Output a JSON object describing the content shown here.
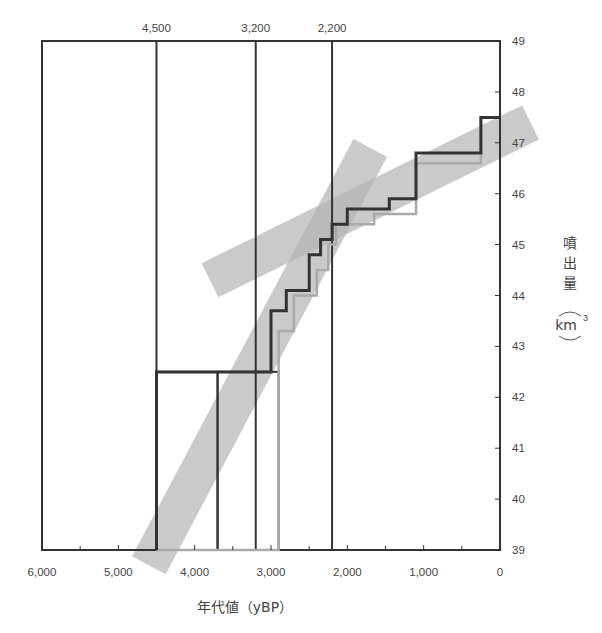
{
  "chart_data": {
    "type": "line",
    "title": "",
    "xlabel": "年代値（yBP）",
    "ylabel": "噴出量（km³）",
    "ylabel_chars": [
      "噴",
      "出",
      "量"
    ],
    "ylabel_unit": "km",
    "ylabel_unit_sup": "3",
    "xlim": [
      6000,
      0
    ],
    "ylim": [
      39,
      49
    ],
    "x_reversed": true,
    "grid": false,
    "x_ticks": [
      6000,
      5000,
      4000,
      3000,
      2000,
      1000,
      0
    ],
    "x_tick_labels": [
      "6,000",
      "5,000",
      "4,000",
      "3,000",
      "2,000",
      "1,000",
      "0"
    ],
    "y_ticks": [
      39,
      40,
      41,
      42,
      43,
      44,
      45,
      46,
      47,
      48,
      49
    ],
    "y_tick_labels": [
      "39",
      "40",
      "41",
      "42",
      "43",
      "44",
      "45",
      "46",
      "47",
      "48",
      "49"
    ],
    "reference_lines": [
      {
        "x": 4500,
        "label": "4,500"
      },
      {
        "x": 3200,
        "label": "3,200"
      },
      {
        "x": 2200,
        "label": "2,200"
      }
    ],
    "series": [
      {
        "name": "cumulative volume (dark)",
        "color": "#333333",
        "step": true,
        "points": [
          [
            4500,
            39.0
          ],
          [
            4500,
            42.5
          ],
          [
            3000,
            42.5
          ],
          [
            3000,
            43.7
          ],
          [
            2800,
            43.7
          ],
          [
            2800,
            44.1
          ],
          [
            2500,
            44.1
          ],
          [
            2500,
            44.8
          ],
          [
            2350,
            44.8
          ],
          [
            2350,
            45.1
          ],
          [
            2200,
            45.1
          ],
          [
            2200,
            45.4
          ],
          [
            2000,
            45.4
          ],
          [
            2000,
            45.7
          ],
          [
            1450,
            45.7
          ],
          [
            1450,
            45.9
          ],
          [
            1100,
            45.9
          ],
          [
            1100,
            46.8
          ],
          [
            250,
            46.8
          ],
          [
            250,
            47.5
          ],
          [
            0,
            47.5
          ]
        ]
      },
      {
        "name": "cumulative volume (light)",
        "color": "#aaaaaa",
        "step": true,
        "points": [
          [
            4500,
            39.0
          ],
          [
            2900,
            39.0
          ],
          [
            2900,
            43.3
          ],
          [
            2700,
            43.3
          ],
          [
            2700,
            44.0
          ],
          [
            2400,
            44.0
          ],
          [
            2400,
            44.5
          ],
          [
            2250,
            44.5
          ],
          [
            2250,
            45.0
          ],
          [
            2150,
            45.0
          ],
          [
            2150,
            45.4
          ],
          [
            1650,
            45.4
          ],
          [
            1650,
            45.6
          ],
          [
            1100,
            45.6
          ],
          [
            1100,
            46.6
          ],
          [
            250,
            46.6
          ],
          [
            250,
            47.5
          ]
        ]
      }
    ],
    "boxes": [
      {
        "x0": 4500,
        "x1": 3700,
        "y0": 39.0,
        "y1": 42.5
      },
      {
        "x0": 3700,
        "x1": 2900,
        "y0": 39.0,
        "y1": 42.5
      }
    ],
    "trend_bands": [
      {
        "name": "steep trend band (older)",
        "from": [
          4600,
          38.7
        ],
        "to": [
          1700,
          46.9
        ],
        "width_px": 38,
        "color": "#b4b4b4",
        "opacity": 0.7
      },
      {
        "name": "shallow trend band (younger)",
        "from": [
          3800,
          44.3
        ],
        "to": [
          -400,
          47.4
        ],
        "width_px": 38,
        "color": "#b4b4b4",
        "opacity": 0.7
      }
    ]
  }
}
